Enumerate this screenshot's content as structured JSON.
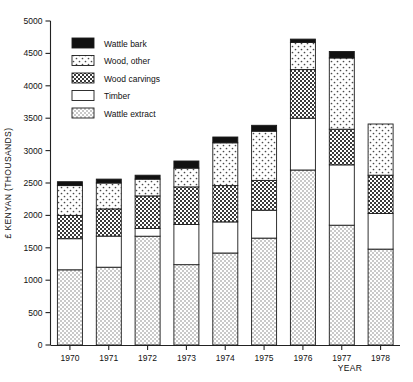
{
  "chart_data": {
    "type": "bar",
    "subtype": "stacked-bar",
    "title": "",
    "xlabel": "YEAR",
    "ylabel": "£ KENYAN (THOUSANDS)",
    "categories": [
      "1970",
      "1971",
      "1972",
      "1973",
      "1974",
      "1975",
      "1976",
      "1977",
      "1978"
    ],
    "ylim": [
      0,
      5000
    ],
    "yticks": [
      0,
      500,
      1000,
      1500,
      2000,
      2500,
      3000,
      3500,
      4000,
      4500,
      5000
    ],
    "grid": false,
    "legend_position": "upper-left-inside",
    "stack_order_bottom_to_top": [
      "Wattle extract",
      "Timber",
      "Wood carvings",
      "Wood, other",
      "Wattle bark"
    ],
    "series": [
      {
        "name": "Wattle extract",
        "fill": "light-stipple",
        "values": [
          1160,
          1200,
          1680,
          1240,
          1420,
          1650,
          2700,
          1850,
          1480
        ]
      },
      {
        "name": "Timber",
        "fill": "white",
        "values": [
          480,
          480,
          120,
          620,
          480,
          430,
          800,
          930,
          550
        ]
      },
      {
        "name": "Wood carvings",
        "fill": "dark-checker",
        "values": [
          360,
          420,
          500,
          580,
          560,
          460,
          750,
          550,
          590
        ]
      },
      {
        "name": "Wood, other",
        "fill": "sparse-dots",
        "values": [
          460,
          400,
          260,
          290,
          660,
          760,
          420,
          1100,
          790
        ]
      },
      {
        "name": "Wattle bark",
        "fill": "solid-black",
        "values": [
          60,
          60,
          60,
          110,
          90,
          90,
          50,
          100,
          0
        ]
      }
    ],
    "totals": [
      2520,
      2560,
      2620,
      2840,
      3210,
      3390,
      4720,
      4530,
      3410
    ]
  },
  "legend": {
    "items": [
      {
        "label": "Wattle bark",
        "swatch": "solid-black"
      },
      {
        "label": "Wood, other",
        "swatch": "sparse-dots"
      },
      {
        "label": "Wood carvings",
        "swatch": "dark-checker"
      },
      {
        "label": "Timber",
        "swatch": "white"
      },
      {
        "label": "Wattle extract",
        "swatch": "light-stipple"
      }
    ]
  },
  "colors": {
    "axis": "#222222",
    "black_fill": "#111111",
    "white_fill": "#ffffff",
    "light_fill": "#d8d8d8",
    "text": "#111111"
  }
}
